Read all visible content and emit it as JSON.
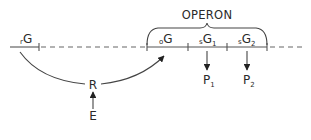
{
  "diagram": {
    "type": "operon-regulation",
    "operon_label": "OPERON",
    "genes": [
      {
        "id": "regulator",
        "prefix": "r",
        "label": "G",
        "suffix": ""
      },
      {
        "id": "operator",
        "prefix": "o",
        "label": "G",
        "suffix": ""
      },
      {
        "id": "structural-1",
        "prefix": "s",
        "label": "G",
        "suffix": "1"
      },
      {
        "id": "structural-2",
        "prefix": "s",
        "label": "G",
        "suffix": "2"
      }
    ],
    "products": [
      {
        "id": "P1",
        "label": "P",
        "suffix": "1"
      },
      {
        "id": "P2",
        "label": "P",
        "suffix": "2"
      }
    ],
    "repressor": {
      "label": "R"
    },
    "effector": {
      "label": "E"
    },
    "colors": {
      "line": "#555555",
      "text": "#2a2a2a",
      "background": "#ffffff"
    }
  }
}
